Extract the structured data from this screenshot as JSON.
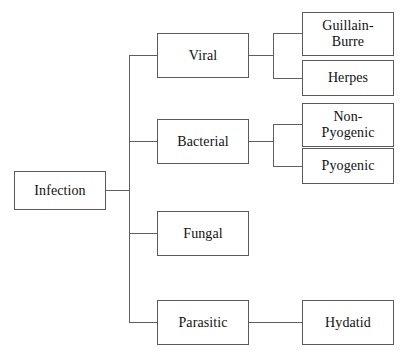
{
  "diagram": {
    "title": "Infection",
    "type": "tree-flowchart",
    "orientation": "left-to-right",
    "line_color": "#5f5f5f",
    "box_border_color": "#5a5a5a",
    "background_color": "#ffffff",
    "text_color": "#111111",
    "nodes": {
      "root": {
        "label": "Infection"
      },
      "level2": [
        {
          "label": "Viral"
        },
        {
          "label": "Bacterial"
        },
        {
          "label": "Fungal"
        },
        {
          "label": "Parasitic"
        }
      ],
      "level3": [
        {
          "label": "Guillain-\nBurre"
        },
        {
          "label": "Herpes"
        },
        {
          "label": "Non-\nPyogenic"
        },
        {
          "label": "Pyogenic"
        },
        {
          "label": "Hydatid"
        }
      ]
    },
    "edges": [
      {
        "from": "Infection",
        "to": "trunk"
      },
      {
        "from": "trunk",
        "to": "Viral"
      },
      {
        "from": "trunk",
        "to": "Bacterial"
      },
      {
        "from": "trunk",
        "to": "Fungal"
      },
      {
        "from": "trunk",
        "to": "Parasitic"
      },
      {
        "from": "Viral",
        "to": "Guillain-Burre"
      },
      {
        "from": "Viral",
        "to": "Herpes"
      },
      {
        "from": "Bacterial",
        "to": "Non-Pyogenic"
      },
      {
        "from": "Bacterial",
        "to": "Pyogenic"
      },
      {
        "from": "Parasitic",
        "to": "Hydatid"
      }
    ]
  }
}
